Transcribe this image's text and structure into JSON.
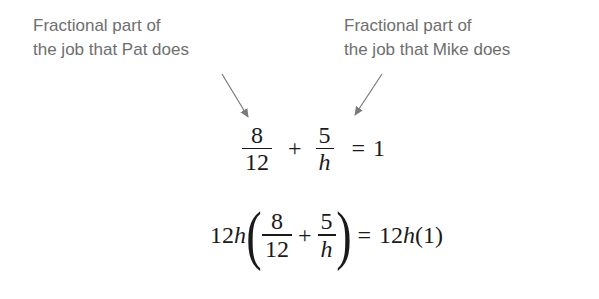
{
  "annotations": {
    "pat": {
      "line1": "Fractional part of",
      "line2": "the job that Pat does"
    },
    "mike": {
      "line1": "Fractional part of",
      "line2": "the job that Mike does"
    }
  },
  "equation1": {
    "term1": {
      "numerator": "8",
      "denominator": "12"
    },
    "plus": "+",
    "term2": {
      "numerator": "5",
      "denominator": "h"
    },
    "equals": "=",
    "rhs": "1"
  },
  "equation2": {
    "multiplier_coef": "12",
    "multiplier_var": "h",
    "open_paren": "(",
    "term1": {
      "numerator": "8",
      "denominator": "12"
    },
    "plus": "+",
    "term2": {
      "numerator": "5",
      "denominator": "h"
    },
    "close_paren": ")",
    "equals": "=",
    "rhs_coef": "12",
    "rhs_var": "h",
    "rhs_paren": "(1)"
  },
  "colors": {
    "annotation_text": "#6e6e6e",
    "arrow": "#7a7a7a",
    "math_text": "#1a1a1a"
  }
}
